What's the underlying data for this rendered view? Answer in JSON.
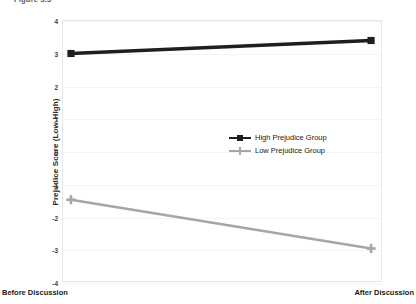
{
  "figure": {
    "caption": "Figure 3.3"
  },
  "chart_data": {
    "type": "line",
    "title": "",
    "xlabel": "",
    "ylabel": "Prejudice Score (Low-High)",
    "categories": [
      "Before Discussion",
      "After Discussion"
    ],
    "ylim": [
      -4,
      4
    ],
    "yticks": [
      4,
      3,
      2,
      1,
      0,
      -1,
      -2,
      -3,
      -4
    ],
    "grid": true,
    "legend_position": "center",
    "series": [
      {
        "name": "High Prejudice Group",
        "values": [
          3.0,
          3.4
        ],
        "color": "#1f1f1f",
        "marker": "square"
      },
      {
        "name": "Low Prejudice Group",
        "values": [
          -1.5,
          -3.0
        ],
        "color": "#a6a6a6",
        "marker": "plus"
      }
    ]
  },
  "axis": {
    "x_left_label": "Before Discussion",
    "x_right_label": "After Discussion"
  }
}
